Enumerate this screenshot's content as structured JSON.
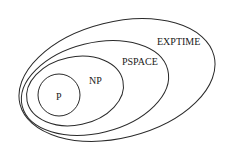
{
  "diagram": {
    "type": "nested-sets",
    "classes": [
      {
        "label": "EXPTIME"
      },
      {
        "label": "PSPACE"
      },
      {
        "label": "NP"
      },
      {
        "label": "P"
      }
    ],
    "colors": {
      "stroke": "#2a2a2a",
      "text": "#1a1a1a",
      "background": "#ffffff"
    }
  }
}
